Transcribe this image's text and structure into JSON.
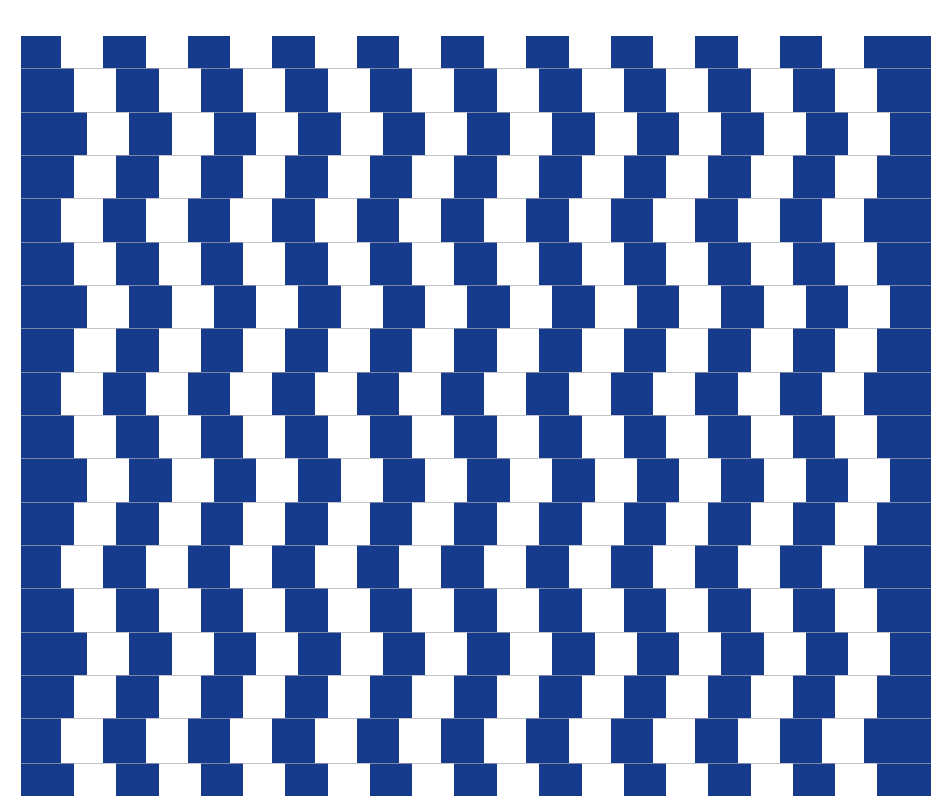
{
  "figure": {
    "type": "cafe-wall-illusion",
    "colors": {
      "background": "#ffffff",
      "blue": "#163a8c",
      "white_tile": "#ffffff",
      "mortar": "#a9a9b4"
    },
    "blue_panel": {
      "left": 21,
      "top": 36,
      "right": 931,
      "bottom": 796
    },
    "rows": {
      "boundaries": [
        36,
        68,
        112,
        155,
        198,
        242,
        285,
        328,
        372,
        415,
        458,
        502,
        545,
        588,
        632,
        675,
        718,
        763,
        796
      ],
      "offset_cycle": [
        0,
        13,
        26,
        13
      ]
    },
    "columns": {
      "first_white_left": 61,
      "period": 84.6,
      "white_width": 42,
      "count": 10
    }
  }
}
